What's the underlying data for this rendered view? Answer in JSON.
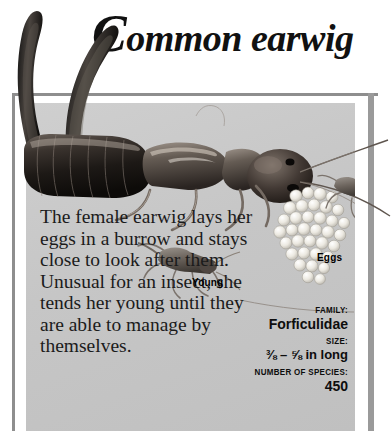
{
  "header": {
    "title_initial": "C",
    "title_rest": "ommon earwig"
  },
  "article": {
    "body": "The female earwig lays her eggs in a burrow and stays close to look after them. Unusual for an insect, she tends her young until they are able to manage by themselves."
  },
  "illustration": {
    "labels": [
      {
        "id": "eggs",
        "text": "Eggs"
      },
      {
        "id": "young",
        "text": "Young"
      }
    ],
    "subject": "common-earwig",
    "palette": {
      "panel_background": "#c9c9c9",
      "frame_rule": "#8e8e8e",
      "body_dark": "#2b2520",
      "egg_light": "#f2f0ea"
    }
  },
  "facts": [
    {
      "key": "FAMILY:",
      "value": "Forficulidae",
      "size": "normal"
    },
    {
      "key": "SIZE:",
      "value": "⅜ – ⅝ in long",
      "size": "small"
    },
    {
      "key": "NUMBER OF SPECIES:",
      "value": "450",
      "size": "normal"
    }
  ]
}
